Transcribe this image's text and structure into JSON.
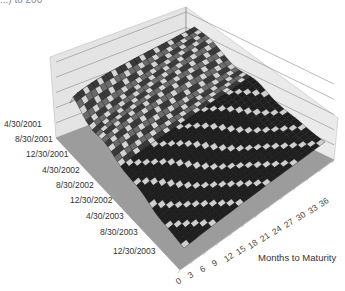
{
  "header": {
    "partial_title": "...) to 200"
  },
  "chart_data": {
    "type": "surface3d",
    "title": "",
    "xlabel": "Months to Maturity",
    "ylabel": "",
    "zlabel": "",
    "x_ticks": [
      "0",
      "3",
      "6",
      "9",
      "12",
      "15",
      "18",
      "21",
      "24",
      "27",
      "30",
      "33",
      "36"
    ],
    "y_ticks": [
      "4/30/2001",
      "8/30/2001",
      "12/30/2001",
      "4/30/2002",
      "8/30/2002",
      "12/30/2002",
      "4/30/2003",
      "8/30/2003",
      "12/30/2003"
    ],
    "z_gridlines": 5,
    "surface_profile": {
      "by_date_index_relative_height": [
        0.95,
        0.85,
        0.7,
        0.62,
        0.55,
        0.45,
        0.35,
        0.28,
        0.22
      ],
      "by_maturity_relative_tilt": "rises mildly with maturity"
    },
    "colors": {
      "floor": "#9a9a9a",
      "walls": "#e6e6e6",
      "gridlines": "#7a7a7a",
      "surface_dark": "#1e1e1e",
      "surface_light": "#d8d8d8"
    }
  },
  "axes": {
    "date_labels": [
      {
        "text": "4/30/2001",
        "x": 4,
        "y": 125
      },
      {
        "text": "8/30/2001",
        "x": 15,
        "y": 140
      },
      {
        "text": "12/30/2001",
        "x": 26,
        "y": 155
      },
      {
        "text": "4/30/2002",
        "x": 42,
        "y": 171
      },
      {
        "text": "8/30/2002",
        "x": 56,
        "y": 186
      },
      {
        "text": "12/30/2002",
        "x": 70,
        "y": 201
      },
      {
        "text": "4/30/2003",
        "x": 86,
        "y": 217
      },
      {
        "text": "8/30/2003",
        "x": 100,
        "y": 233
      },
      {
        "text": "12/30/2003",
        "x": 113,
        "y": 252
      }
    ],
    "maturity_labels": [
      {
        "text": "0",
        "x": 176,
        "y": 276
      },
      {
        "text": "3",
        "x": 188,
        "y": 270
      },
      {
        "text": "6",
        "x": 200,
        "y": 264
      },
      {
        "text": "9",
        "x": 212,
        "y": 258
      },
      {
        "text": "12",
        "x": 224,
        "y": 252
      },
      {
        "text": "15",
        "x": 236,
        "y": 245
      },
      {
        "text": "18",
        "x": 248,
        "y": 239
      },
      {
        "text": "21",
        "x": 260,
        "y": 232
      },
      {
        "text": "24",
        "x": 272,
        "y": 225
      },
      {
        "text": "27",
        "x": 284,
        "y": 218
      },
      {
        "text": "30",
        "x": 296,
        "y": 211
      },
      {
        "text": "33",
        "x": 308,
        "y": 204
      },
      {
        "text": "36",
        "x": 319,
        "y": 197
      }
    ],
    "maturity_title": "Months to Maturity"
  }
}
